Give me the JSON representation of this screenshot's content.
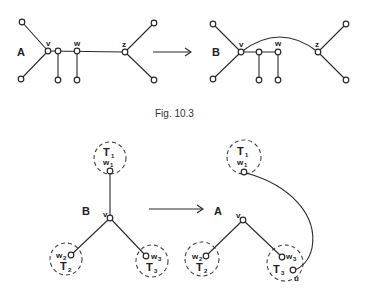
{
  "figure": {
    "caption": "Fig. 10.3",
    "top": {
      "left_graph": {
        "label": "A",
        "v": "v",
        "w": "w",
        "z": "z"
      },
      "right_graph": {
        "label": "B",
        "v": "v",
        "w": "w",
        "z": "z"
      },
      "arrow": "transform"
    },
    "bottom": {
      "left_graph": {
        "label": "B",
        "v": "v",
        "subtrees": [
          {
            "name": "T",
            "sub": "1",
            "node": "w",
            "node_sub": "1"
          },
          {
            "name": "T",
            "sub": "2",
            "node": "w",
            "node_sub": "2"
          },
          {
            "name": "T",
            "sub": "3",
            "node": "w",
            "node_sub": "3"
          }
        ]
      },
      "right_graph": {
        "label": "A",
        "v": "v",
        "u": "u",
        "subtrees": [
          {
            "name": "T",
            "sub": "1",
            "node": "w",
            "node_sub": "1"
          },
          {
            "name": "T",
            "sub": "2",
            "node": "w",
            "node_sub": "2"
          },
          {
            "name": "T",
            "sub": "3",
            "node": "w",
            "node_sub": "3"
          }
        ]
      },
      "arrow": "transform"
    }
  }
}
